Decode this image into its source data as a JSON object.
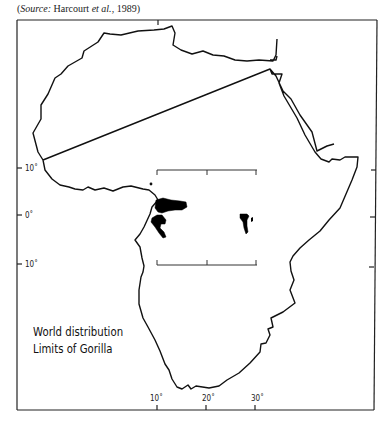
{
  "source": {
    "prefix": "(",
    "label": "Source:",
    "author": " Harcourt ",
    "etal": "et al.",
    "suffix": ", 1989)"
  },
  "map": {
    "region": "Africa",
    "latitude_labels": [
      "10˚",
      "0˚",
      "10˚"
    ],
    "longitude_labels": [
      "10˚",
      "20˚",
      "30˚"
    ],
    "distribution_areas": [
      {
        "name": "Western gorilla range",
        "location": "Central-west Africa near equator coast"
      },
      {
        "name": "Eastern gorilla range",
        "location": "East-central Africa near 30˚ longitude"
      }
    ],
    "colors": {
      "outline": "#111111",
      "range_fill": "#000000",
      "background": "#ffffff"
    }
  },
  "legend": {
    "line1": "World distribution",
    "line2": "Limits of Gorilla"
  }
}
